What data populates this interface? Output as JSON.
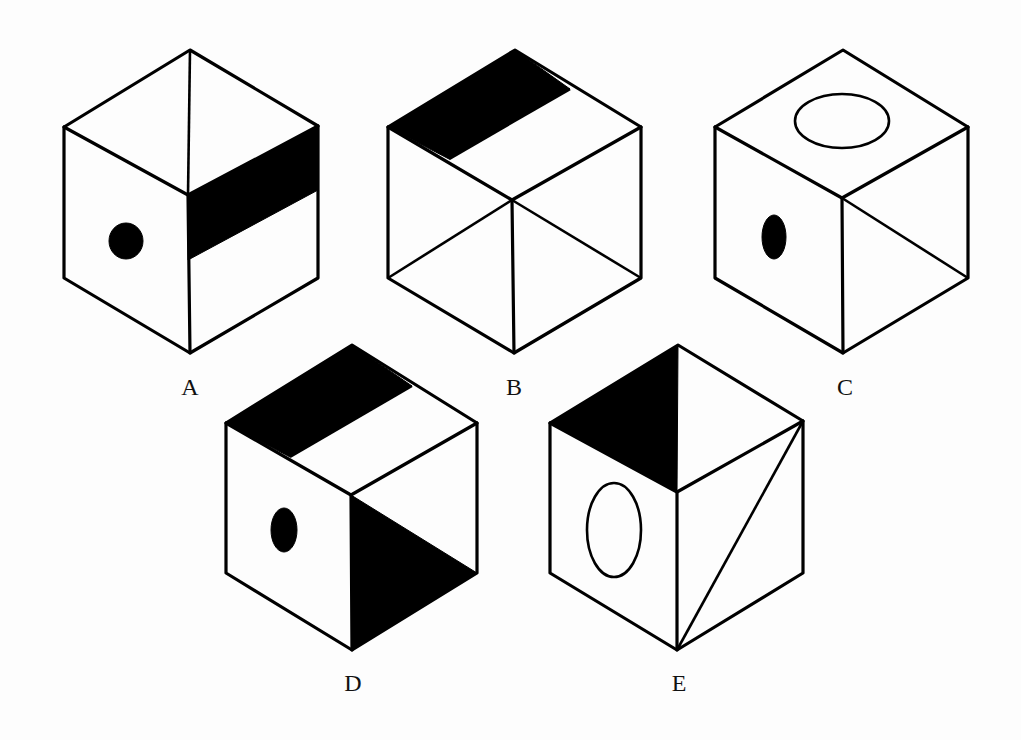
{
  "figure": {
    "cubes": [
      {
        "label": "A",
        "top_face": "split by a line from back vertex to front center vertex",
        "left_face": "black circle",
        "right_face": "black horizontal band across upper part"
      },
      {
        "label": "B",
        "top_face": "black band along back-left edge",
        "left_face": "diagonal line from center vertex to lower-left vertex",
        "right_face": "diagonal line from center vertex to lower-right vertex",
        "front_edge": "vertical line"
      },
      {
        "label": "C",
        "top_face": "hollow ellipse",
        "left_face": "black vertical oval",
        "right_face": "diagonal from center vertex to lower-right vertex"
      },
      {
        "label": "D",
        "top_face": "black band along back-left edge",
        "left_face": "black vertical oval",
        "right_face": "black triangle in lower-left half"
      },
      {
        "label": "E",
        "top_face": "black triangle on left half",
        "left_face": "hollow vertical ellipse",
        "right_face": "diagonal from upper-right vertex to bottom vertex"
      }
    ]
  },
  "labels": {
    "a": "A",
    "b": "B",
    "c": "C",
    "d": "D",
    "e": "E"
  },
  "colors": {
    "ink": "#000000",
    "paper": "#fdfdfd"
  }
}
